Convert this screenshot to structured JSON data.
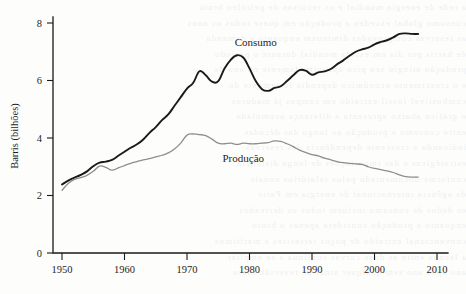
{
  "chart_data": {
    "type": "line",
    "title": "",
    "subtitle": "",
    "xlabel": "",
    "ylabel": "Barris (bilhões)",
    "xlim": [
      1948,
      2012
    ],
    "ylim": [
      0,
      8.6
    ],
    "grid": false,
    "legend_position": "inline-annotation",
    "x_ticks": [
      "1950",
      "1960",
      "1970",
      "1980",
      "1990",
      "2000",
      "2010"
    ],
    "x_tick_values": [
      1950,
      1960,
      1970,
      1980,
      1990,
      2000,
      2010
    ],
    "y_ticks": [
      "0",
      "2",
      "4",
      "6",
      "8"
    ],
    "y_tick_values": [
      0,
      2,
      4,
      6,
      8
    ],
    "x": [
      1950,
      1951,
      1952,
      1953,
      1954,
      1955,
      1956,
      1957,
      1958,
      1959,
      1960,
      1961,
      1962,
      1963,
      1964,
      1965,
      1966,
      1967,
      1968,
      1969,
      1970,
      1971,
      1972,
      1973,
      1974,
      1975,
      1976,
      1977,
      1978,
      1979,
      1980,
      1981,
      1982,
      1983,
      1984,
      1985,
      1986,
      1987,
      1988,
      1989,
      1990,
      1991,
      1992,
      1993,
      1994,
      1995,
      1996,
      1997,
      1998,
      1999,
      2000,
      2001,
      2002,
      2003,
      2004,
      2005,
      2006,
      2007
    ],
    "series": [
      {
        "name": "Consumo",
        "color": "#1a1a1a",
        "line_width": 1.9,
        "label_x": 1981,
        "label_y": 7.2,
        "values": [
          2.38,
          2.52,
          2.62,
          2.72,
          2.84,
          3.02,
          3.14,
          3.18,
          3.24,
          3.38,
          3.52,
          3.66,
          3.78,
          3.95,
          4.18,
          4.38,
          4.62,
          4.82,
          5.12,
          5.42,
          5.72,
          5.92,
          6.32,
          6.18,
          5.96,
          5.98,
          6.42,
          6.72,
          6.88,
          6.8,
          6.42,
          5.98,
          5.7,
          5.64,
          5.74,
          5.8,
          5.98,
          6.18,
          6.36,
          6.34,
          6.2,
          6.28,
          6.32,
          6.4,
          6.56,
          6.7,
          6.86,
          7.0,
          7.08,
          7.14,
          7.26,
          7.34,
          7.4,
          7.5,
          7.62,
          7.64,
          7.62,
          7.62
        ]
      },
      {
        "name": "Produção",
        "color": "#8e8e8e",
        "line_width": 1.3,
        "label_x": 1979,
        "label_y": 3.18,
        "values": [
          2.18,
          2.42,
          2.56,
          2.62,
          2.7,
          2.84,
          3.02,
          2.98,
          2.88,
          2.96,
          3.04,
          3.12,
          3.18,
          3.24,
          3.28,
          3.34,
          3.4,
          3.48,
          3.62,
          3.82,
          4.1,
          4.14,
          4.12,
          4.08,
          3.96,
          3.82,
          3.8,
          3.82,
          3.78,
          3.82,
          3.8,
          3.8,
          3.82,
          3.84,
          3.9,
          3.88,
          3.8,
          3.7,
          3.58,
          3.5,
          3.42,
          3.38,
          3.3,
          3.24,
          3.18,
          3.14,
          3.12,
          3.1,
          3.08,
          3.0,
          2.94,
          2.9,
          2.86,
          2.8,
          2.72,
          2.66,
          2.64,
          2.64
        ]
      }
    ]
  },
  "labels": {
    "y_axis_title": "Barris (bilhões)",
    "consumo": "Consumo",
    "producao": "Produção"
  },
  "colors": {
    "consumo_line": "#1a1a1a",
    "producao_line": "#8e8e8e",
    "axis": "#1a1a1a",
    "page_background": "#fdfdfc"
  },
  "page_artifacts": {
    "bleed_text_lines": [
      "a rede de energia mundial e os recursos de petróleo bruto",
      "consumo global excedeu a produção em quase todos os anos",
      "as reservas comprovadas diminuem enquanto a demanda",
      "de barris por dia em escala mundial durante o período",
      "produção atingiu seu pico aproximadamente no ano de",
      "e o crescimento econômico dependia fortemente do",
      "combustível fóssil extraído em campos já maduros",
      "o gráfico abaixo apresenta a diferença acumulada",
      "entre consumo e produção ao longo das décadas",
      "indicando a crescente dependência das reservas",
      "estratégicas e das importações de longa distância",
      "conforme documentado pelos relatórios anuais",
      "da agência internacional de energia em Paris",
      "os dados de consumo incluem todos os derivados",
      "enquanto a produção considera apenas o bruto",
      "convencional extraído de poços terrestres e marítimos",
      "a lacuna entre as duas curvas continua a se ampliar",
      "ano após ano sem qualquer sinal de reversão clara"
    ]
  }
}
